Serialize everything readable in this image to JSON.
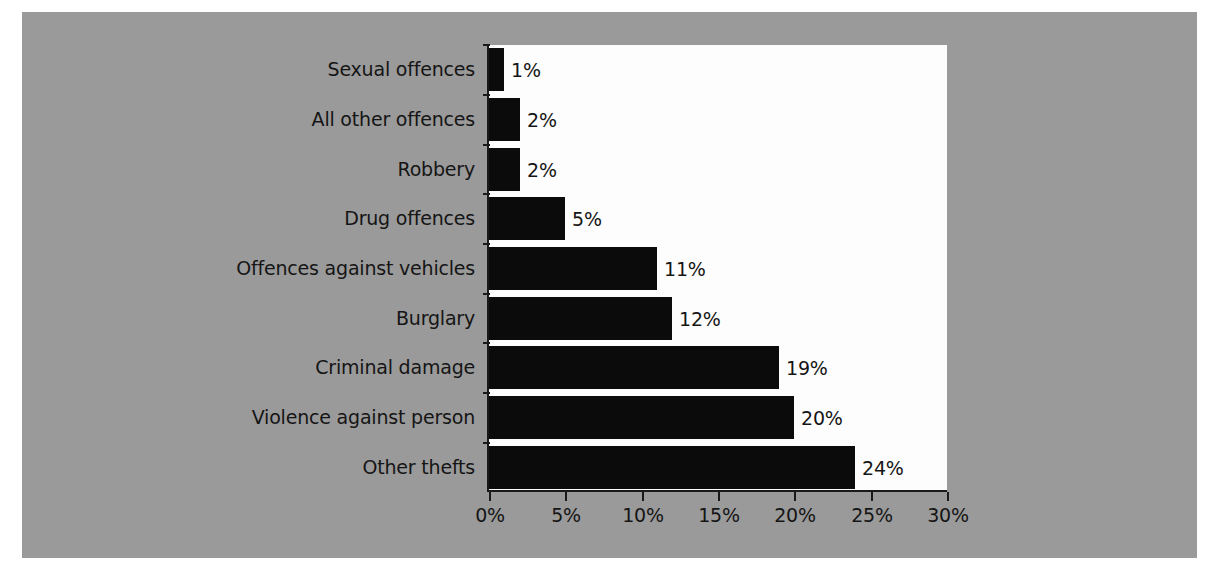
{
  "chart_data": {
    "type": "bar",
    "orientation": "horizontal",
    "title": "",
    "subtitle": "",
    "xlabel": "",
    "ylabel": "",
    "categories": [
      "Sexual offences",
      "All other offences",
      "Robbery",
      "Drug offences",
      "Offences against vehicles",
      "Burglary",
      "Criminal damage",
      "Violence against person",
      "Other thefts"
    ],
    "values": [
      1,
      2,
      2,
      5,
      11,
      12,
      19,
      20,
      24
    ],
    "data_labels": [
      "1%",
      "2%",
      "2%",
      "5%",
      "11%",
      "12%",
      "19%",
      "20%",
      "24%"
    ],
    "xlim": [
      0,
      30
    ],
    "x_ticks": [
      0,
      5,
      10,
      15,
      20,
      25,
      30
    ],
    "x_tick_labels": [
      "0%",
      "5%",
      "10%",
      "15%",
      "20%",
      "25%",
      "30%"
    ],
    "grid": false,
    "legend": null,
    "bar_color": "#0b0b0b",
    "plot_background": "#fdfdfd",
    "figure_background": "#9a9a9a",
    "axis_color": "#1a1a1a",
    "text_color": "#151515"
  }
}
